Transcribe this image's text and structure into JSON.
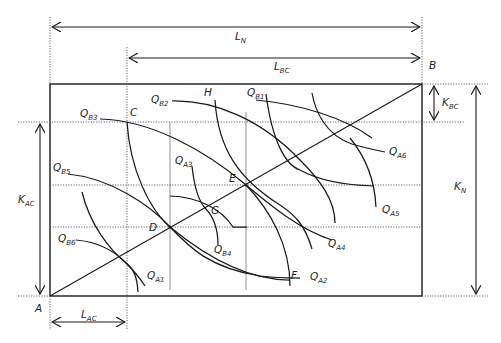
{
  "diagram": {
    "title": "",
    "dimensions": {
      "top_width": "L_N",
      "top_inner_width": "L_BC",
      "bottom_width": "L_AC",
      "right_height": "K_N",
      "right_inner_height": "K_BC",
      "left_height": "K_AC"
    },
    "labels": {
      "LN": {
        "main": "L",
        "sub": "N"
      },
      "LBC": {
        "main": "L",
        "sub": "BC"
      },
      "LAC": {
        "main": "L",
        "sub": "AC"
      },
      "KN": {
        "main": "K",
        "sub": "N"
      },
      "KBC": {
        "main": "K",
        "sub": "BC"
      },
      "KAC": {
        "main": "K",
        "sub": "AC"
      }
    },
    "points": {
      "A": "A",
      "B": "B",
      "C": "C",
      "D": "D",
      "E": "E",
      "F": "F",
      "G": "G",
      "H": "H"
    },
    "isoquants_B": [
      {
        "main": "Q",
        "sub": "B1"
      },
      {
        "main": "Q",
        "sub": "B2"
      },
      {
        "main": "Q",
        "sub": "B3"
      },
      {
        "main": "Q",
        "sub": "B4"
      },
      {
        "main": "Q",
        "sub": "B5"
      },
      {
        "main": "Q",
        "sub": "B6"
      }
    ],
    "isoquants_A": [
      {
        "main": "Q",
        "sub": "A1"
      },
      {
        "main": "Q",
        "sub": "A2"
      },
      {
        "main": "Q",
        "sub": "A3"
      },
      {
        "main": "Q",
        "sub": "A4"
      },
      {
        "main": "Q",
        "sub": "A5"
      },
      {
        "main": "Q",
        "sub": "A6"
      }
    ]
  }
}
